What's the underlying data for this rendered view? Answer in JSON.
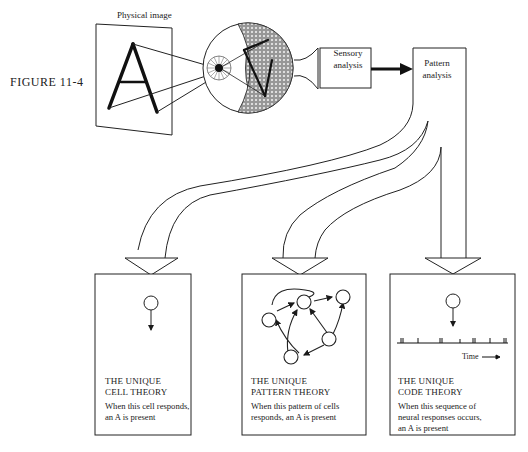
{
  "figure_label": "FIGURE 11-4",
  "top": {
    "physical_image_label": "Physical image",
    "letter": "A",
    "sensory_box": {
      "line1": "Sensory",
      "line2": "analysis"
    },
    "pattern_box": {
      "line1": "Pattern",
      "line2": "analysis"
    }
  },
  "panels": [
    {
      "title_line1": "THE UNIQUE",
      "title_line2": "CELL THEORY",
      "desc_line1": "When this cell responds,",
      "desc_line2": "an A is present",
      "desc_line3": ""
    },
    {
      "title_line1": "THE UNIQUE",
      "title_line2": "PATTERN THEORY",
      "desc_line1": "When this pattern of cells",
      "desc_line2": "responds, an A is present",
      "desc_line3": ""
    },
    {
      "title_line1": "THE UNIQUE",
      "title_line2": "CODE THEORY",
      "desc_line1": "When this sequence of",
      "desc_line2": "neural responses occurs,",
      "desc_line3": "an A is present"
    }
  ],
  "code_panel": {
    "time_label": "Time"
  },
  "colors": {
    "ink": "#1a1a1a",
    "background": "#ffffff"
  }
}
